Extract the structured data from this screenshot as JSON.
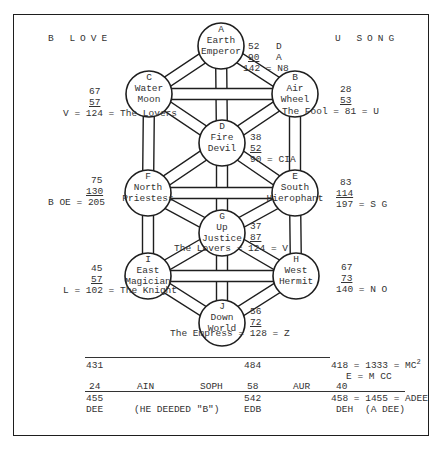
{
  "header": {
    "left_title": "B LOVE",
    "right_title": "U SONG"
  },
  "nodes": [
    {
      "id": "A",
      "element": "Earth",
      "card": "Emperor",
      "cx": 221,
      "cy": 46
    },
    {
      "id": "B",
      "element": "Air",
      "card": "Wheel",
      "cx": 295,
      "cy": 94
    },
    {
      "id": "C",
      "element": "Water",
      "card": "Moon",
      "cx": 149,
      "cy": 94
    },
    {
      "id": "D",
      "element": "Fire",
      "card": "Devil",
      "cx": 222,
      "cy": 143
    },
    {
      "id": "E",
      "element": "South",
      "card": "Hierophant",
      "cx": 295,
      "cy": 193
    },
    {
      "id": "F",
      "element": "North",
      "card": "Priestess",
      "cx": 148,
      "cy": 193
    },
    {
      "id": "G",
      "element": "Up",
      "card": "Justice",
      "cx": 222,
      "cy": 233
    },
    {
      "id": "H",
      "element": "West",
      "card": "Hermit",
      "cx": 296,
      "cy": 276
    },
    {
      "id": "I",
      "element": "East",
      "card": "Magician",
      "cx": 148,
      "cy": 276
    },
    {
      "id": "J",
      "element": "Down",
      "card": "World",
      "cx": 222,
      "cy": 323
    }
  ],
  "sums": {
    "A": {
      "a": "52",
      "a_note": "D",
      "b": "90",
      "b_note": "A",
      "total": "142 = N8"
    },
    "B": {
      "a": "28",
      "b": "53",
      "total": "The Fool = 81 = U"
    },
    "C": {
      "a": "67",
      "b": "57",
      "total": "V = 124 = The Lovers"
    },
    "D": {
      "a": "38",
      "b": "52",
      "total": "90 = CIA"
    },
    "E": {
      "a": "83",
      "b": "114",
      "total": "197 = S G"
    },
    "F": {
      "a": "75",
      "b": "130",
      "total": "B OE = 205"
    },
    "G": {
      "a": "37",
      "b": "87",
      "total": "The Lovers = 124 = V"
    },
    "H": {
      "a": "67",
      "b": "73",
      "total": "140 = N O"
    },
    "I": {
      "a": "45",
      "b": "57",
      "total": "L = 102 = The Knight"
    },
    "J": {
      "a": "56",
      "b": "72",
      "total": "The Empress = 128 = Z"
    }
  },
  "footer": {
    "row1": {
      "c1": "431",
      "c3": "484",
      "c5": "418 = 1333 = MC",
      "sup": "2"
    },
    "row2": {
      "c5": "E = M CC"
    },
    "row3": {
      "c1": "24",
      "c2": "AIN",
      "c3a": "SOPH",
      "c3": "58",
      "c4": "AUR",
      "c5": "40"
    },
    "row4": {
      "c1": "455",
      "c3": "542",
      "c5": "458 = 1455 = ADEE"
    },
    "row5": {
      "c1": "DEE",
      "c2": "(HE DEEDED \"B\")",
      "c3": "EDB",
      "c5a": "DEH",
      "c5": "(A DEE)"
    }
  },
  "colors": {
    "ink": "#1e1e1e",
    "text": "#333333",
    "paper": "#ffffff"
  }
}
